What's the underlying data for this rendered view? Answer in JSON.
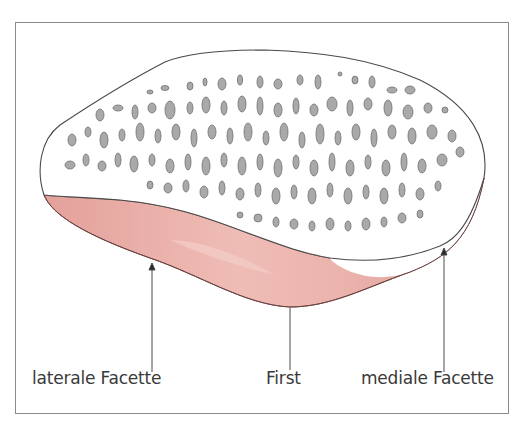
{
  "figure": {
    "colors": {
      "outline": "#4a4a4a",
      "cartilage": "#e8aaa4",
      "cartilage_highlight": "#f3cdc8",
      "cartilage_edge": "#7a4a48",
      "trabecular_holes": "#a9a9a9",
      "trabecular_hole_edge": "#6f6f6f",
      "frame": "#8a8a8a",
      "label_text": "#3a3a3a"
    },
    "labels": [
      {
        "text": "laterale Facette",
        "pointer": "arrow"
      },
      {
        "text": "First",
        "pointer": "line"
      },
      {
        "text": "mediale Facette",
        "pointer": "arrow"
      }
    ]
  }
}
